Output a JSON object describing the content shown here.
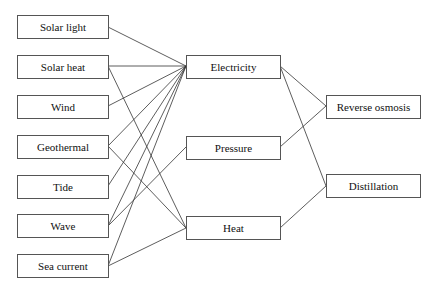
{
  "diagram": {
    "sources": [
      {
        "id": "solar_light",
        "label": "Solar light"
      },
      {
        "id": "solar_heat",
        "label": "Solar heat"
      },
      {
        "id": "wind",
        "label": "Wind"
      },
      {
        "id": "geothermal",
        "label": "Geothermal"
      },
      {
        "id": "tide",
        "label": "Tide"
      },
      {
        "id": "wave",
        "label": "Wave"
      },
      {
        "id": "sea_current",
        "label": "Sea current"
      }
    ],
    "intermediates": [
      {
        "id": "electricity",
        "label": "Electricity"
      },
      {
        "id": "pressure",
        "label": "Pressure"
      },
      {
        "id": "heat",
        "label": "Heat"
      }
    ],
    "processes": [
      {
        "id": "reverse_osmosis",
        "label": "Reverse osmosis"
      },
      {
        "id": "distillation",
        "label": "Distillation"
      }
    ],
    "edges": [
      [
        "solar_light",
        "electricity"
      ],
      [
        "solar_heat",
        "electricity"
      ],
      [
        "solar_heat",
        "heat"
      ],
      [
        "wind",
        "electricity"
      ],
      [
        "geothermal",
        "electricity"
      ],
      [
        "geothermal",
        "heat"
      ],
      [
        "tide",
        "electricity"
      ],
      [
        "wave",
        "electricity"
      ],
      [
        "wave",
        "pressure"
      ],
      [
        "sea_current",
        "electricity"
      ],
      [
        "sea_current",
        "heat"
      ],
      [
        "electricity",
        "reverse_osmosis"
      ],
      [
        "electricity",
        "distillation"
      ],
      [
        "pressure",
        "reverse_osmosis"
      ],
      [
        "heat",
        "distillation"
      ]
    ]
  }
}
